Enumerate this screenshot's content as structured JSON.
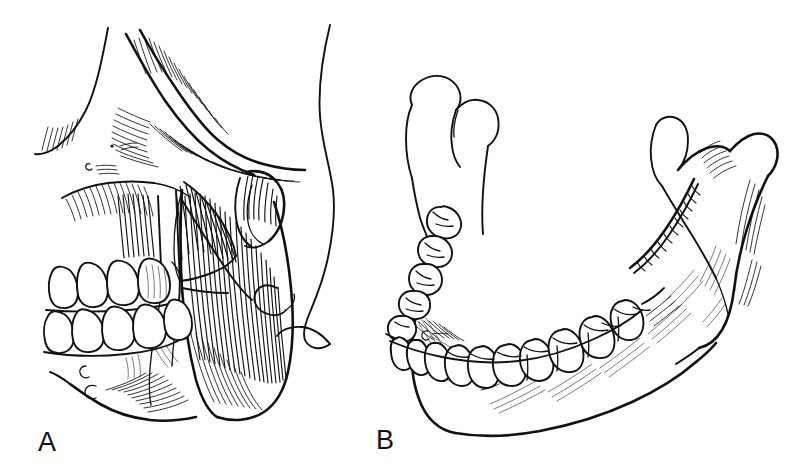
{
  "figure": {
    "background_color": "#ffffff",
    "ink_color": "#111111",
    "width": 807,
    "height": 471,
    "style": "pen-and-ink line drawing with hatching"
  },
  "panels": [
    {
      "id": "A",
      "label": "A",
      "label_x": 38,
      "label_y": 451,
      "subject": "lateral view of skull and face profile with masseter muscle in place",
      "structures": [
        "zygomatic-arch",
        "zygomatic-bone",
        "maxilla",
        "maxillary-teeth",
        "mandibular-teeth",
        "mandible-body",
        "masseter-superficial-head",
        "masseter-deep-head",
        "ear-auricle",
        "face-profile-outline",
        "mental-foramen"
      ]
    },
    {
      "id": "B",
      "label": "B",
      "label_x": 376,
      "label_y": 449,
      "subject": "isolated mandible, oblique anterolateral view",
      "structures": [
        "left-condylar-process",
        "left-coronoid-process",
        "left-mandibular-notch",
        "left-ramus",
        "right-condylar-process",
        "right-coronoid-process",
        "right-mandibular-notch",
        "right-ramus",
        "mandibular-body",
        "mandibular-angle",
        "oblique-line",
        "mental-foramen",
        "mandibular-dental-arch"
      ],
      "teeth_near_arch": 9,
      "teeth_far_arch": 7
    }
  ],
  "labels": {
    "panel_a": "A",
    "panel_b": "B"
  }
}
